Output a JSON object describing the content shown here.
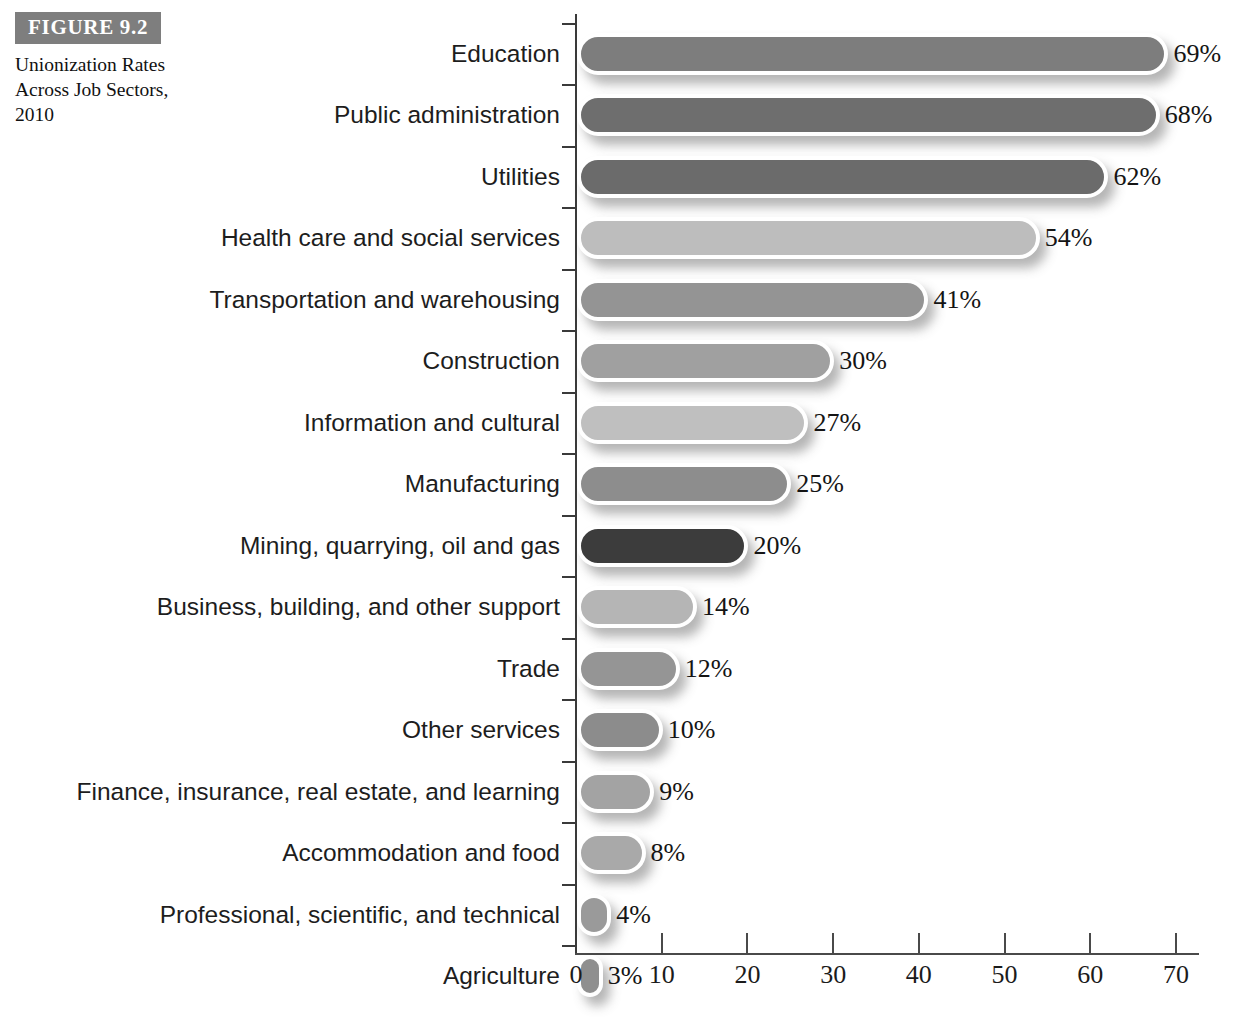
{
  "figure": {
    "badge": "FIGURE 9.2",
    "caption": "Unionization Rates Across Job Sectors, 2010"
  },
  "chart_data": {
    "type": "bar",
    "orientation": "horizontal",
    "title": "Unionization Rates Across Job Sectors, 2010",
    "xlabel": "",
    "ylabel": "",
    "xlim": [
      0,
      75
    ],
    "xticks": [
      0,
      10,
      20,
      30,
      40,
      50,
      60,
      70
    ],
    "grid": false,
    "legend": null,
    "value_suffix": "%",
    "categories": [
      "Education",
      "Public administration",
      "Utilities",
      "Health care and social services",
      "Transportation and warehousing",
      "Construction",
      "Information and cultural",
      "Manufacturing",
      "Mining, quarrying, oil and gas",
      "Business, building, and other support",
      "Trade",
      "Other services",
      "Finance, insurance, real estate, and learning",
      "Accommodation and food",
      "Professional, scientific, and technical",
      "Agriculture"
    ],
    "values": [
      69,
      68,
      62,
      54,
      41,
      30,
      27,
      25,
      20,
      14,
      12,
      10,
      9,
      8,
      4,
      3
    ],
    "value_labels": [
      "69%",
      "68%",
      "62%",
      "54%",
      "41%",
      "30%",
      "27%",
      "25%",
      "20%",
      "14%",
      "12%",
      "10%",
      "9%",
      "8%",
      "4%",
      "3%"
    ],
    "bar_colors": [
      "#7d7d7d",
      "#6e6e6e",
      "#6b6b6b",
      "#bdbdbd",
      "#949494",
      "#a0a0a0",
      "#bfbfbf",
      "#8d8d8d",
      "#3c3c3c",
      "#b5b5b5",
      "#959595",
      "#8c8c8c",
      "#a3a3a3",
      "#a9a9a9",
      "#9a9a9a",
      "#8f8f8f"
    ],
    "bar_outline_color": "#ffffff",
    "axis_color": "#3a3a3a"
  }
}
